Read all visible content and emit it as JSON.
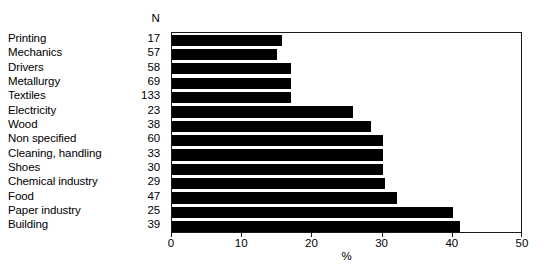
{
  "chart_data": {
    "type": "bar",
    "orientation": "horizontal",
    "title": "",
    "xlabel": "%",
    "ylabel": "",
    "xlim": [
      0,
      50
    ],
    "xticks": [
      0,
      10,
      20,
      30,
      40,
      50
    ],
    "xtick_labels": [
      "0",
      "10",
      "20",
      "30",
      "40",
      "50"
    ],
    "grid": false,
    "legend": null,
    "n_column_header": "N",
    "categories": [
      "Printing",
      "Mechanics",
      "Drivers",
      "Metallurgy",
      "Textiles",
      "Electricity",
      "Wood",
      "Non specified",
      "Cleaning, handling",
      "Shoes",
      "Chemical industry",
      "Food",
      "Paper industry",
      "Building"
    ],
    "n_values": [
      17,
      57,
      58,
      69,
      133,
      23,
      38,
      60,
      33,
      30,
      29,
      47,
      25,
      39
    ],
    "values": [
      15.7,
      15.0,
      17.0,
      17.0,
      17.0,
      25.8,
      28.4,
      30.0,
      30.0,
      30.0,
      30.4,
      32.0,
      40.0,
      41.0
    ],
    "rows": [
      {
        "category": "Printing",
        "n": "17",
        "value": 15.7
      },
      {
        "category": "Mechanics",
        "n": "57",
        "value": 15.0
      },
      {
        "category": "Drivers",
        "n": "58",
        "value": 17.0
      },
      {
        "category": "Metallurgy",
        "n": "69",
        "value": 17.0
      },
      {
        "category": "Textiles",
        "n": "133",
        "value": 17.0
      },
      {
        "category": "Electricity",
        "n": "23",
        "value": 25.8
      },
      {
        "category": "Wood",
        "n": "38",
        "value": 28.4
      },
      {
        "category": "Non specified",
        "n": "60",
        "value": 30.0
      },
      {
        "category": "Cleaning, handling",
        "n": "33",
        "value": 30.0
      },
      {
        "category": "Shoes",
        "n": "30",
        "value": 30.0
      },
      {
        "category": "Chemical industry",
        "n": "29",
        "value": 30.4
      },
      {
        "category": "Food",
        "n": "47",
        "value": 32.0
      },
      {
        "category": "Paper industry",
        "n": "25",
        "value": 40.0
      },
      {
        "category": "Building",
        "n": "39",
        "value": 41.0
      }
    ],
    "colors": {
      "bar": "#000000",
      "axis": "#1a1a1a",
      "background": "#ffffff",
      "text": "#000000"
    }
  }
}
